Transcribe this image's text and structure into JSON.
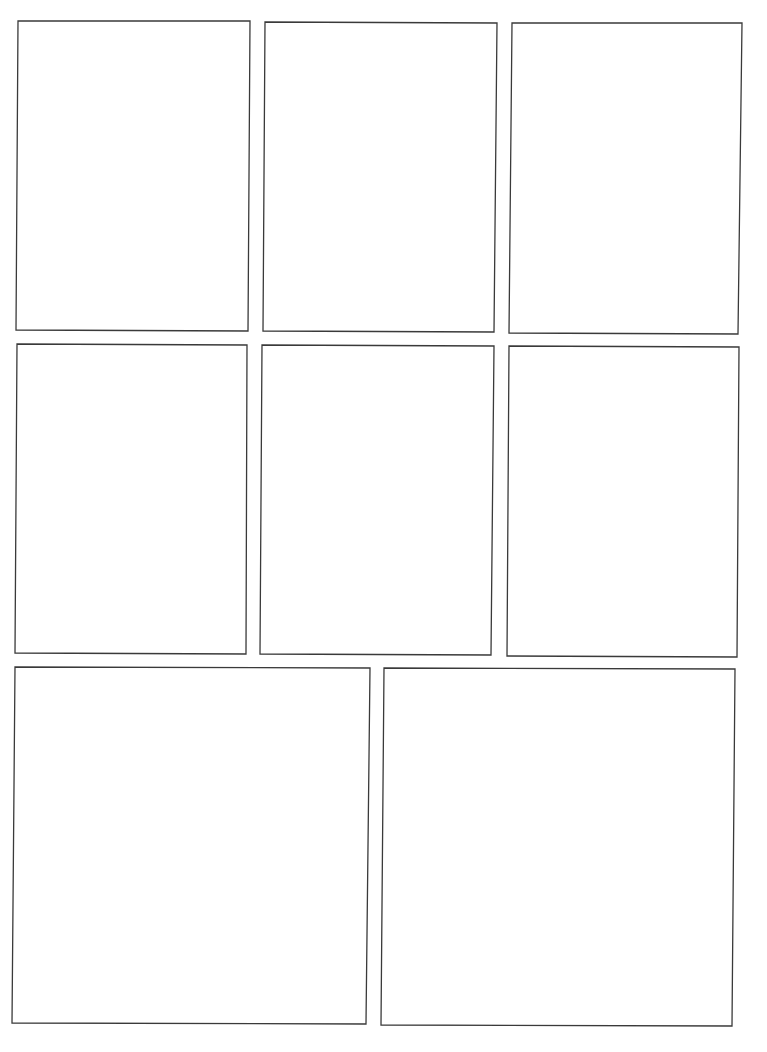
{
  "page": {
    "type": "blank comic panel template",
    "background": "#ffffff",
    "border_color": "#3a3a3a",
    "panel_count": 8
  },
  "panels": [
    {
      "id": 1,
      "row": 1,
      "points": "18,21 250,21 248,331 16,330"
    },
    {
      "id": 2,
      "row": 1,
      "points": "265,22 497,23 494,332 263,331"
    },
    {
      "id": 3,
      "row": 1,
      "points": "512,23 742,23 738,334 509,333"
    },
    {
      "id": 4,
      "row": 2,
      "points": "17,344 247,345 246,654 15,653"
    },
    {
      "id": 5,
      "row": 2,
      "points": "262,345 494,346 491,655 260,654"
    },
    {
      "id": 6,
      "row": 2,
      "points": "509,346 739,347 737,657 507,656"
    },
    {
      "id": 7,
      "row": 3,
      "points": "15,667 370,668 366,1024 12,1023"
    },
    {
      "id": 8,
      "row": 3,
      "points": "384,668 735,669 732,1026 381,1025"
    }
  ]
}
